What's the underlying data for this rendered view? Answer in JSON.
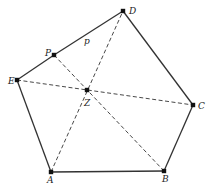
{
  "diagram": {
    "points": [
      {
        "id": "D",
        "label": "D",
        "x": 123,
        "y": 11,
        "lx": 129,
        "ly": 14
      },
      {
        "id": "P",
        "label": "P",
        "x": 54,
        "y": 55,
        "lx": 45,
        "ly": 56
      },
      {
        "id": "E",
        "label": "E",
        "x": 17,
        "y": 80,
        "lx": 8,
        "ly": 84
      },
      {
        "id": "Z",
        "label": "Z",
        "x": 87,
        "y": 90,
        "lx": 84,
        "ly": 106
      },
      {
        "id": "C",
        "label": "C",
        "x": 193,
        "y": 105,
        "lx": 198,
        "ly": 109
      },
      {
        "id": "A",
        "label": "A",
        "x": 51,
        "y": 172,
        "lx": 47,
        "ly": 183
      },
      {
        "id": "B",
        "label": "B",
        "x": 164,
        "y": 171,
        "lx": 162,
        "ly": 182
      }
    ],
    "solid_edges": [
      [
        "A",
        "B"
      ],
      [
        "B",
        "C"
      ],
      [
        "C",
        "D"
      ],
      [
        "D",
        "P"
      ],
      [
        "P",
        "E"
      ],
      [
        "E",
        "A"
      ]
    ],
    "dashed_edges": [
      [
        "E",
        "C"
      ],
      [
        "P",
        "B"
      ],
      [
        "A",
        "D"
      ]
    ],
    "segment_label": {
      "text": "p",
      "x": 84,
      "y": 44
    }
  }
}
